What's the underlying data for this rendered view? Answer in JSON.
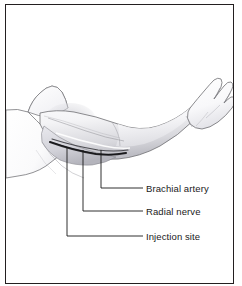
{
  "figure": {
    "background_color": "#ffffff",
    "border_color": "#231f20",
    "line_color": "#1a1a1a",
    "skin_outline_color": "#6e6e72",
    "vessel_color": "#2b2b2e",
    "shading_light": "#fbfbfc",
    "shading_mid": "#e4e4e7",
    "shading_dark": "#b9b9bf"
  },
  "callouts": [
    {
      "id": "brachial-artery",
      "label": "Brachial artery",
      "leader": {
        "anchor_x": 101,
        "anchor_y": 150,
        "elbow_y": 188,
        "end_x": 143
      }
    },
    {
      "id": "radial-nerve",
      "label": "Radial nerve",
      "leader": {
        "anchor_x": 83,
        "anchor_y": 150,
        "elbow_y": 211,
        "end_x": 143
      }
    },
    {
      "id": "injection-site",
      "label": "Injection site",
      "leader": {
        "anchor_x": 67,
        "anchor_y": 147,
        "elbow_y": 236,
        "end_x": 143
      }
    }
  ]
}
